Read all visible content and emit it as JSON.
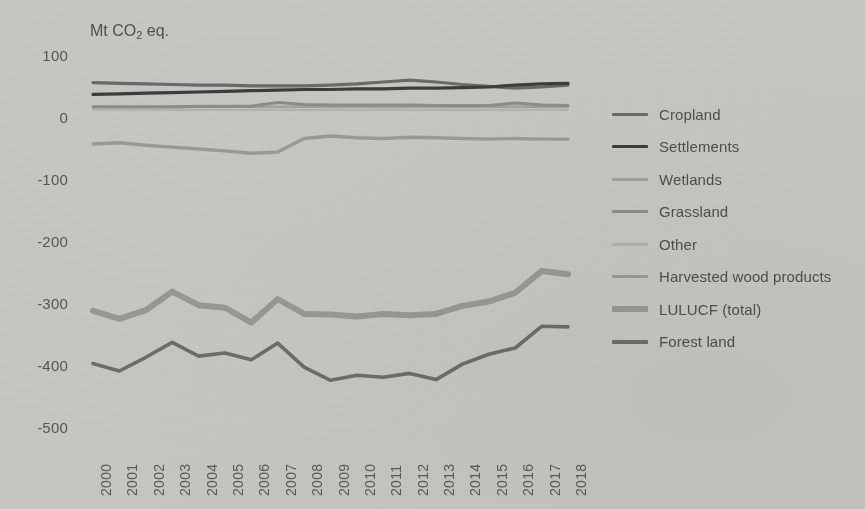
{
  "chart_data": {
    "type": "line",
    "title": "Mt CO2 eq.",
    "title_parts": {
      "prefix": "Mt CO",
      "sub": "2",
      "suffix": " eq."
    },
    "xlabel": "",
    "ylabel": "Mt CO2 eq.",
    "ylim": [
      -500,
      100
    ],
    "yticks": [
      100,
      0,
      -100,
      -200,
      -300,
      -400,
      -500
    ],
    "ytick_labels": [
      "100",
      "0",
      "-100",
      "-200",
      "-300",
      "-400",
      "-500"
    ],
    "grid": false,
    "legend_position": "right",
    "x": [
      2000,
      2001,
      2002,
      2003,
      2004,
      2005,
      2006,
      2007,
      2008,
      2009,
      2010,
      2011,
      2012,
      2013,
      2014,
      2015,
      2016,
      2017,
      2018
    ],
    "categories": [
      "2000",
      "2001",
      "2002",
      "2003",
      "2004",
      "2005",
      "2006",
      "2007",
      "2008",
      "2009",
      "2010",
      "2011",
      "2012",
      "2013",
      "2014",
      "2015",
      "2016",
      "2017",
      "2018"
    ],
    "series": [
      {
        "name": "Cropland",
        "color": "#6b6b6b",
        "width": 3.2,
        "values": [
          57,
          56,
          55,
          54,
          53,
          53,
          52,
          52,
          52,
          53,
          55,
          58,
          61,
          58,
          54,
          51,
          48,
          50,
          53
        ]
      },
      {
        "name": "Settlements",
        "color": "#3d3d3d",
        "width": 3.2,
        "values": [
          38,
          39,
          40,
          41,
          42,
          43,
          44,
          45,
          46,
          46,
          47,
          47,
          48,
          48,
          49,
          50,
          53,
          55,
          56
        ]
      },
      {
        "name": "Wetlands",
        "color": "#a2a2a2",
        "width": 2.6,
        "values": [
          17,
          17,
          17,
          17,
          18,
          18,
          18,
          18,
          18,
          18,
          18,
          18,
          18,
          18,
          18,
          18,
          18,
          18,
          18
        ]
      },
      {
        "name": "Grassland",
        "color": "#8d8d8d",
        "width": 3.0,
        "values": [
          18,
          18,
          18,
          18,
          19,
          19,
          19,
          25,
          22,
          21,
          21,
          21,
          21,
          20,
          20,
          20,
          24,
          21,
          20
        ]
      },
      {
        "name": "Other",
        "color": "#b4b4b4",
        "width": 2.2,
        "values": [
          13,
          13,
          13,
          13,
          13,
          13,
          13,
          13,
          13,
          13,
          13,
          13,
          13,
          13,
          13,
          13,
          13,
          13,
          13
        ]
      },
      {
        "name": "Harvested wood products",
        "color": "#9b9b9b",
        "width": 3.4,
        "values": [
          -42,
          -40,
          -44,
          -47,
          -50,
          -53,
          -57,
          -55,
          -33,
          -29,
          -32,
          -33,
          -31,
          -32,
          -33,
          -34,
          -33,
          -34,
          -34
        ]
      },
      {
        "name": "LULUCF (total)",
        "color": "#999999",
        "width": 6.0,
        "values": [
          -311,
          -324,
          -310,
          -280,
          -302,
          -306,
          -330,
          -292,
          -316,
          -317,
          -320,
          -316,
          -318,
          -316,
          -303,
          -296,
          -282,
          -247,
          -252
        ]
      },
      {
        "name": "Forest land",
        "color": "#6e6e6e",
        "width": 3.6,
        "values": [
          -396,
          -408,
          -386,
          -362,
          -384,
          -379,
          -390,
          -363,
          -402,
          -423,
          -415,
          -418,
          -412,
          -422,
          -397,
          -381,
          -371,
          -336,
          -337
        ]
      }
    ]
  },
  "legend": {
    "items": [
      {
        "label": "Cropland"
      },
      {
        "label": "Settlements"
      },
      {
        "label": "Wetlands"
      },
      {
        "label": "Grassland"
      },
      {
        "label": "Other"
      },
      {
        "label": "Harvested wood products"
      },
      {
        "label": "LULUCF (total)"
      },
      {
        "label": "Forest land"
      }
    ]
  },
  "colors": {
    "background": "#c9c9c4",
    "text": "#4f4f4f",
    "cropland": "#6b6b6b",
    "settlements": "#3d3d3d",
    "wetlands": "#a2a2a2",
    "grassland": "#8d8d8d",
    "other": "#b4b4b4",
    "harvested_wood_products": "#9b9b9b",
    "lulucf_total": "#999999",
    "forest_land": "#6e6e6e"
  }
}
